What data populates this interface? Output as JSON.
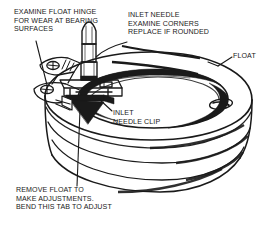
{
  "diagram": {
    "type": "technical-line-drawing",
    "background_color": "#ffffff",
    "line_color": "#1a1a1a",
    "width": 276,
    "height": 229
  },
  "callouts": {
    "hinge": {
      "name": "examine-float-hinge",
      "text": "EXAMINE FLOAT HINGE\nFOR WEAR AT BEARING\nSURFACES",
      "lines": [
        "EXAMINE FLOAT HINGE",
        "FOR WEAR AT BEARING",
        "SURFACES"
      ],
      "align": "left"
    },
    "inlet_needle": {
      "name": "inlet-needle",
      "text": "INLET NEEDLE\nEXAMINE CORNERS\nREPLACE IF ROUNDED",
      "lines": [
        "INLET NEEDLE",
        "EXAMINE CORNERS",
        "REPLACE IF ROUNDED"
      ],
      "align": "left"
    },
    "float": {
      "name": "float",
      "text": "FLOAT",
      "lines": [
        "FLOAT"
      ],
      "align": "left"
    },
    "needle_clip": {
      "name": "inlet-needle-clip",
      "text": "INLET\nNEEDLE CLIP",
      "lines": [
        "INLET",
        "NEEDLE CLIP"
      ],
      "align": "left"
    },
    "remove_float": {
      "name": "remove-float-adjust",
      "text": "REMOVE FLOAT TO\nMAKE ADJUSTMENTS.\nBEND THIS TAB TO ADJUST",
      "lines": [
        "REMOVE FLOAT TO",
        "MAKE ADJUSTMENTS.",
        "BEND THIS TAB TO ADJUST"
      ],
      "align": "left"
    }
  },
  "parts": [
    {
      "name": "float-body",
      "description": "Toroidal ring-shaped float with horizontal seam bands"
    },
    {
      "name": "float-center-bowl",
      "description": "Recessed elliptical center opening of float"
    },
    {
      "name": "float-vent-dimple-right",
      "description": "Small elliptical dimple on right face of float"
    },
    {
      "name": "float-hinge-arms",
      "description": "Two hinge arms with circular pivot bearing holes"
    },
    {
      "name": "inlet-needle",
      "description": "Tapered vertical needle with pointed tip"
    },
    {
      "name": "inlet-needle-clip",
      "description": "Small wire clip attaching needle to float tab"
    },
    {
      "name": "adjustment-tab",
      "description": "Bendable metal tab beneath hinge"
    }
  ]
}
